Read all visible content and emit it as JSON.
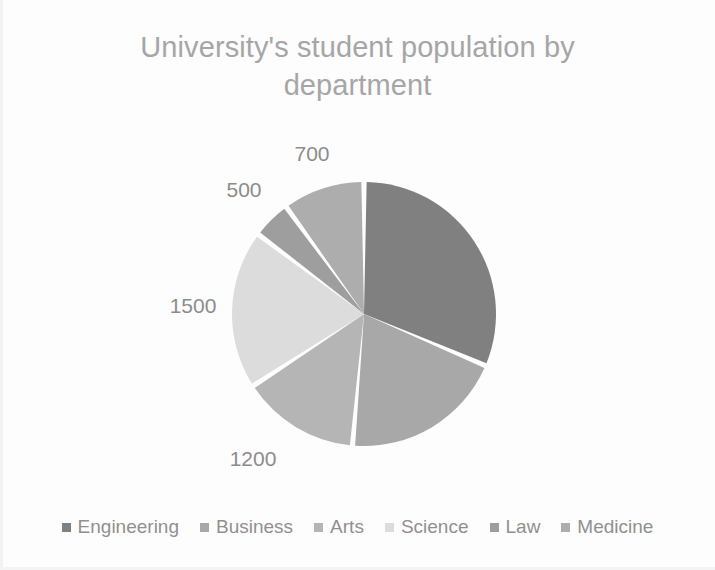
{
  "chart_data": {
    "type": "pie",
    "title": "University's student population by department",
    "categories": [
      "Engineering",
      "Business",
      "Arts",
      "Science",
      "Law",
      "Medicine"
    ],
    "values": [
      2400,
      1200,
      1100,
      1500,
      500,
      700
    ],
    "data_labels": [
      "",
      "1200",
      "",
      "1500",
      "500",
      "700"
    ],
    "colors": [
      "#808080",
      "#a8a8a8",
      "#b5b5b5",
      "#dcdcdc",
      "#9e9e9e",
      "#adadad"
    ],
    "slice_start_angles": [
      0,
      113,
      185,
      237,
      307,
      324
    ],
    "slice_end_angles": [
      113,
      185,
      237,
      307,
      324,
      360
    ],
    "start_angle_deg": 0,
    "direction": "clockwise",
    "legend_position": "bottom",
    "grid": false,
    "xlabel": "",
    "ylabel": ""
  },
  "title": {
    "line1": "University's student population by",
    "line2": "department",
    "text": "University's student population by department",
    "color": "#a6a6a6"
  },
  "pie": {
    "center_x": 364,
    "center_y": 314,
    "radius": 132,
    "separator_color": "#ffffff",
    "slices": [
      {
        "name": "Engineering",
        "value": 2400,
        "color": "#808080",
        "start": 0,
        "end": 113,
        "label": ""
      },
      {
        "name": "Business",
        "value": 1200,
        "color": "#a8a8a8",
        "start": 113,
        "end": 185,
        "label": "1200"
      },
      {
        "name": "Arts",
        "value": 1100,
        "color": "#b5b5b5",
        "start": 185,
        "end": 237,
        "label": ""
      },
      {
        "name": "Science",
        "value": 1500,
        "color": "#dcdcdc",
        "start": 237,
        "end": 307,
        "label": "1500"
      },
      {
        "name": "Law",
        "value": 500,
        "color": "#9e9e9e",
        "start": 307,
        "end": 324,
        "label": "500"
      },
      {
        "name": "Medicine",
        "value": 700,
        "color": "#adadad",
        "start": 324,
        "end": 360,
        "label": "700"
      }
    ]
  },
  "data_labels": [
    {
      "text": "700",
      "x": 312,
      "y": 154,
      "series": "Medicine"
    },
    {
      "text": "500",
      "x": 244,
      "y": 190,
      "series": "Law"
    },
    {
      "text": "1500",
      "x": 193,
      "y": 306,
      "series": "Science"
    },
    {
      "text": "1200",
      "x": 253,
      "y": 459,
      "series": "Business"
    }
  ],
  "legend": {
    "items": [
      {
        "label": "Engineering",
        "color": "#808080"
      },
      {
        "label": "Business",
        "color": "#a8a8a8"
      },
      {
        "label": "Arts",
        "color": "#b5b5b5"
      },
      {
        "label": "Science",
        "color": "#dcdcdc"
      },
      {
        "label": "Law",
        "color": "#9e9e9e"
      },
      {
        "label": "Medicine",
        "color": "#adadad"
      }
    ]
  }
}
